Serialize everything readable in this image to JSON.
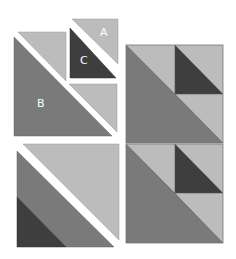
{
  "diagram": {
    "type": "quilt-block-assembly",
    "labels": {
      "a": "A",
      "b": "B",
      "c": "C"
    },
    "colors": {
      "light": "#bcbcbc",
      "medium": "#7a7a7a",
      "dark": "#3e3e3e",
      "label_on_light": "#ffffff",
      "label_on_dark": "#ffffff",
      "background": "#ffffff"
    },
    "pieces": [
      {
        "id": "A",
        "shade": "light",
        "shape": "half-square triangle"
      },
      {
        "id": "B",
        "shade": "medium",
        "shape": "large half-square triangle"
      },
      {
        "id": "C",
        "shade": "dark",
        "shape": "half-square triangle"
      }
    ]
  }
}
